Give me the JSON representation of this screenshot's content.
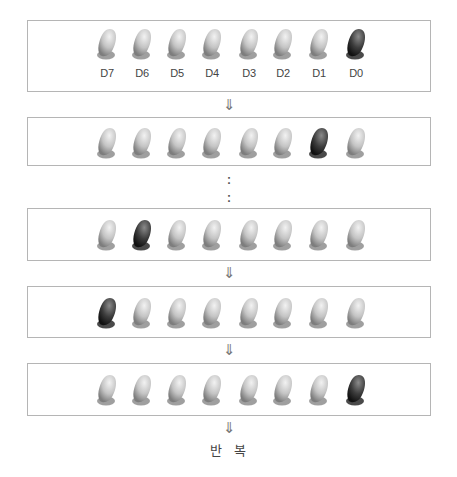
{
  "diagram": {
    "type": "led-ring-counter-sequence",
    "bit_labels": [
      "D7",
      "D6",
      "D5",
      "D4",
      "D3",
      "D2",
      "D1",
      "D0"
    ],
    "colors": {
      "panel_border": "#b5b5b5",
      "led_off": "#c9c9c9",
      "led_on": "#3a3a3a",
      "arrow": "#777777"
    },
    "states": [
      {
        "name": "state-1",
        "active_bit": "D0",
        "leds": [
          0,
          0,
          0,
          0,
          0,
          0,
          0,
          1
        ]
      },
      {
        "name": "state-2",
        "active_bit": "D1",
        "leds": [
          0,
          0,
          0,
          0,
          0,
          0,
          1,
          0
        ]
      },
      {
        "name": "state-7",
        "active_bit": "D6",
        "leds": [
          0,
          1,
          0,
          0,
          0,
          0,
          0,
          0
        ]
      },
      {
        "name": "state-8",
        "active_bit": "D7",
        "leds": [
          1,
          0,
          0,
          0,
          0,
          0,
          0,
          0
        ]
      },
      {
        "name": "state-9",
        "active_bit": "D0",
        "leds": [
          0,
          0,
          0,
          0,
          0,
          0,
          0,
          1
        ]
      }
    ],
    "arrow_glyph": "⇓",
    "ellipsis_glyph": ":",
    "repeat_label": "반 복"
  }
}
